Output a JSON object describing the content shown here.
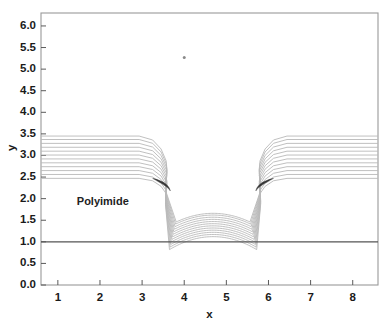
{
  "chart_data": {
    "type": "line",
    "title": "",
    "subtitle": "",
    "xlabel": "x",
    "ylabel": "y",
    "xlim": [
      0.6,
      8.6
    ],
    "ylim": [
      0.0,
      6.3
    ],
    "xticks": [
      1,
      2,
      3,
      4,
      5,
      6,
      7,
      8
    ],
    "xtick_labels": [
      "1",
      "2",
      "3",
      "4",
      "5",
      "6",
      "7",
      "8"
    ],
    "yticks": [
      0.0,
      0.5,
      1.0,
      1.5,
      2.0,
      2.5,
      3.0,
      3.5,
      4.0,
      4.5,
      5.0,
      5.5,
      6.0
    ],
    "ytick_labels": [
      "0.0",
      "0.5",
      "1.0",
      "1.5",
      "2.0",
      "2.5",
      "3.0",
      "3.5",
      "4.0",
      "4.5",
      "5.0",
      "5.5",
      "6.0"
    ],
    "grid": false,
    "legend": null,
    "annotations": [
      {
        "text": "Polyimide",
        "x": 1.45,
        "y": 1.9
      }
    ],
    "substrate_line": {
      "label": "substrate",
      "y": 1.0,
      "x_start": 0.6,
      "x_end": 8.6,
      "color": "#555555"
    },
    "trench": {
      "left_wall_x": 3.55,
      "right_wall_x": 5.82,
      "floor_y": 1.0,
      "top_y": 2.45
    },
    "profile_count": 12,
    "profile_color": "#b9b9b9",
    "profile_dark_color": "#2a2a2a",
    "flat_top_levels": [
      2.47,
      2.56,
      2.65,
      2.74,
      2.83,
      2.92,
      3.01,
      3.1,
      3.19,
      3.28,
      3.37,
      3.45
    ],
    "dome_peak_levels": [
      1.12,
      1.17,
      1.22,
      1.27,
      1.32,
      1.37,
      1.42,
      1.47,
      1.52,
      1.57,
      1.62,
      1.66
    ],
    "series": [
      {
        "name": "profile-1",
        "flat_top": 2.47,
        "dome_peak": 1.12
      },
      {
        "name": "profile-2",
        "flat_top": 2.56,
        "dome_peak": 1.17
      },
      {
        "name": "profile-3",
        "flat_top": 2.65,
        "dome_peak": 1.22
      },
      {
        "name": "profile-4",
        "flat_top": 2.74,
        "dome_peak": 1.27
      },
      {
        "name": "profile-5",
        "flat_top": 2.83,
        "dome_peak": 1.32
      },
      {
        "name": "profile-6",
        "flat_top": 2.92,
        "dome_peak": 1.37
      },
      {
        "name": "profile-7",
        "flat_top": 3.01,
        "dome_peak": 1.42
      },
      {
        "name": "profile-8",
        "flat_top": 3.1,
        "dome_peak": 1.47
      },
      {
        "name": "profile-9",
        "flat_top": 3.19,
        "dome_peak": 1.52
      },
      {
        "name": "profile-10",
        "flat_top": 3.28,
        "dome_peak": 1.57
      },
      {
        "name": "profile-11",
        "flat_top": 3.37,
        "dome_peak": 1.62
      },
      {
        "name": "profile-12",
        "flat_top": 3.45,
        "dome_peak": 1.66
      }
    ],
    "artifact_dot": {
      "x": 4.0,
      "y": 5.27
    }
  },
  "colors": {
    "frame": "#9a9a9a",
    "text": "#1a1a1a",
    "contour": "#b9b9b9",
    "contour_dark": "#2a2a2a",
    "substrate": "#555555",
    "background": "#ffffff"
  }
}
